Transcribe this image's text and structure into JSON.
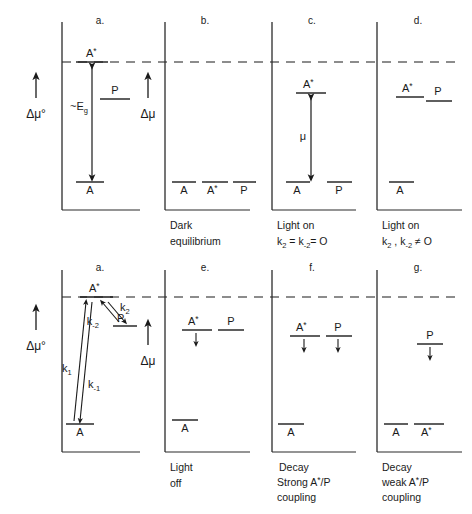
{
  "figure": {
    "reference_line": "dashed horizontal reference level (A* excited-state level)",
    "axis_labels": {
      "delta_mu_standard": "Δμ°",
      "delta_mu": "Δμ"
    }
  },
  "rows": [
    {
      "row_id": "top",
      "axis_left": {
        "label": "Δμ°",
        "arrow": "up-arrow-icon"
      },
      "axis_mid": {
        "label": "Δμ",
        "arrow": "up-arrow-icon"
      },
      "panels": [
        {
          "letter": "a.",
          "caption": [],
          "levels": [
            {
              "name": "A*",
              "base": "A",
              "star": true,
              "x": 0.42,
              "y": 0.14,
              "width": 0.22
            },
            {
              "name": "P",
              "base": "P",
              "star": false,
              "x": 0.74,
              "y": 0.38,
              "width": 0.2
            },
            {
              "name": "A",
              "base": "A",
              "star": false,
              "x": 0.42,
              "y": 0.84,
              "width": 0.2
            }
          ],
          "arrows": [
            {
              "kind": "double-vertical",
              "label": "~E",
              "label_sub": "g",
              "x": 0.42,
              "y1": 0.16,
              "y2": 0.84
            }
          ]
        },
        {
          "letter": "b.",
          "caption": [
            "Dark",
            "equilibrium"
          ],
          "levels": [
            {
              "name": "A",
              "base": "A",
              "star": false,
              "x": 0.2,
              "y": 0.84,
              "width": 0.2
            },
            {
              "name": "A*",
              "base": "A",
              "star": true,
              "x": 0.5,
              "y": 0.84,
              "width": 0.22
            },
            {
              "name": "P",
              "base": "P",
              "star": false,
              "x": 0.8,
              "y": 0.84,
              "width": 0.2
            }
          ],
          "arrows": []
        },
        {
          "letter": "c.",
          "caption": [
            "Light on",
            "k₂ = k₋₂= O"
          ],
          "caption_rich": [
            {
              "text": "Light on"
            },
            {
              "text": "k",
              "sub": "2",
              "text2": " = k",
              "sub2": "-2",
              "text3": "= O"
            }
          ],
          "levels": [
            {
              "name": "A*",
              "base": "A",
              "star": true,
              "x": 0.45,
              "y": 0.3,
              "width": 0.24
            },
            {
              "name": "A",
              "base": "A",
              "star": false,
              "x": 0.25,
              "y": 0.84,
              "width": 0.2
            },
            {
              "name": "P",
              "base": "P",
              "star": false,
              "x": 0.78,
              "y": 0.84,
              "width": 0.2
            }
          ],
          "arrows": [
            {
              "kind": "double-vertical",
              "label": "μ",
              "label_sub": "",
              "x": 0.45,
              "y1": 0.33,
              "y2": 0.84
            }
          ]
        },
        {
          "letter": "d.",
          "caption": [
            "Light on",
            "k₂ , k₋₂ ≠ O"
          ],
          "caption_rich": [
            {
              "text": "Light on"
            },
            {
              "text": "k",
              "sub": "2",
              "text2": " , k",
              "sub2": "-2",
              "text3": " ≠ O"
            }
          ],
          "levels": [
            {
              "name": "A*",
              "base": "A",
              "star": true,
              "x": 0.4,
              "y": 0.33,
              "width": 0.24
            },
            {
              "name": "P",
              "base": "P",
              "star": false,
              "x": 0.72,
              "y": 0.38,
              "width": 0.22
            },
            {
              "name": "A",
              "base": "A",
              "star": false,
              "x": 0.26,
              "y": 0.84,
              "width": 0.2
            }
          ],
          "arrows": []
        }
      ]
    },
    {
      "row_id": "bottom",
      "axis_left": {
        "label": "Δμ°",
        "arrow": "up-arrow-icon"
      },
      "axis_mid": {
        "label": "Δμ",
        "arrow": "up-arrow-icon"
      },
      "panels": [
        {
          "letter": "a.",
          "caption": [],
          "levels": [
            {
              "name": "A*",
              "base": "A",
              "star": true,
              "x": 0.45,
              "y": 0.16,
              "width": 0.26
            },
            {
              "name": "P",
              "base": "P",
              "star": false,
              "x": 0.74,
              "y": 0.33,
              "width": 0.2
            },
            {
              "name": "A",
              "base": "A",
              "star": false,
              "x": 0.22,
              "y": 0.83,
              "width": 0.22
            }
          ],
          "kinetic_arrows": [
            {
              "label": "k",
              "sub": "1",
              "direction": "up",
              "from": "A",
              "to": "A*"
            },
            {
              "label": "k",
              "sub": "-1",
              "direction": "down",
              "from": "A*",
              "to": "A"
            },
            {
              "label": "k",
              "sub": "2",
              "direction": "down",
              "from": "A*",
              "to": "P"
            },
            {
              "label": "k",
              "sub": "-2",
              "direction": "up",
              "from": "P",
              "to": "A*"
            }
          ]
        },
        {
          "letter": "e.",
          "caption": [
            "Light",
            "off"
          ],
          "levels": [
            {
              "name": "A*",
              "base": "A",
              "star": true,
              "x": 0.38,
              "y": 0.3,
              "width": 0.24,
              "decay_arrow": true
            },
            {
              "name": "P",
              "base": "P",
              "star": false,
              "x": 0.72,
              "y": 0.3,
              "width": 0.22,
              "decay_arrow": false
            },
            {
              "name": "A",
              "base": "A",
              "star": false,
              "x": 0.22,
              "y": 0.8,
              "width": 0.2,
              "decay_arrow": false
            }
          ]
        },
        {
          "letter": "f.",
          "caption": [
            "Decay",
            "Strong A*/P",
            "coupling"
          ],
          "caption_rich": [
            {
              "text": "Decay"
            },
            {
              "text": "Strong A",
              "star": true,
              "text2": "/P"
            },
            {
              "text": "coupling"
            }
          ],
          "levels": [
            {
              "name": "A*",
              "base": "A",
              "star": true,
              "x": 0.4,
              "y": 0.33,
              "width": 0.24,
              "decay_arrow": true
            },
            {
              "name": "P",
              "base": "P",
              "star": false,
              "x": 0.72,
              "y": 0.33,
              "width": 0.22,
              "decay_arrow": true
            },
            {
              "name": "A",
              "base": "A",
              "star": false,
              "x": 0.2,
              "y": 0.82,
              "width": 0.2,
              "decay_arrow": false
            }
          ]
        },
        {
          "letter": "g.",
          "caption": [
            "Decay",
            "weak A*/P",
            "coupling"
          ],
          "caption_rich": [
            {
              "text": "Decay"
            },
            {
              "text": "weak  A",
              "star": true,
              "text2": "/P"
            },
            {
              "text": "coupling"
            }
          ],
          "levels": [
            {
              "name": "P",
              "base": "P",
              "star": false,
              "x": 0.6,
              "y": 0.38,
              "width": 0.22,
              "decay_arrow": true
            },
            {
              "name": "A",
              "base": "A",
              "star": false,
              "x": 0.2,
              "y": 0.82,
              "width": 0.2,
              "decay_arrow": false
            },
            {
              "name": "A*",
              "base": "A",
              "star": true,
              "x": 0.5,
              "y": 0.82,
              "width": 0.22,
              "decay_arrow": false
            }
          ]
        }
      ]
    }
  ],
  "colors": {
    "ink": "#1a1a1a",
    "line": "#2b2b2b",
    "background": "#ffffff"
  }
}
